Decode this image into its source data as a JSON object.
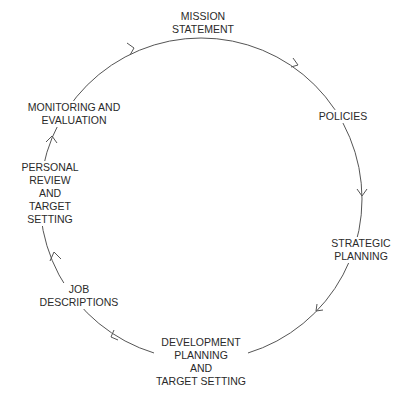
{
  "diagram": {
    "type": "cycle",
    "direction": "clockwise",
    "colors": {
      "line": "#555555",
      "text": "#2a2a2a",
      "background": "#ffffff"
    },
    "nodes": [
      {
        "id": "mission",
        "lines": [
          "MISSION",
          "STATEMENT"
        ]
      },
      {
        "id": "policies",
        "lines": [
          "POLICIES"
        ]
      },
      {
        "id": "strategic",
        "lines": [
          "STRATEGIC",
          "PLANNING"
        ]
      },
      {
        "id": "development",
        "lines": [
          "DEVELOPMENT",
          "PLANNING",
          "AND",
          "TARGET SETTING"
        ]
      },
      {
        "id": "job",
        "lines": [
          "JOB",
          "DESCRIPTIONS"
        ]
      },
      {
        "id": "personal",
        "lines": [
          "PERSONAL",
          "REVIEW",
          "AND",
          "TARGET",
          "SETTING"
        ]
      },
      {
        "id": "monitoring",
        "lines": [
          "MONITORING AND",
          "EVALUATION"
        ]
      }
    ],
    "edges": [
      [
        "mission",
        "policies"
      ],
      [
        "policies",
        "strategic"
      ],
      [
        "strategic",
        "development"
      ],
      [
        "development",
        "job"
      ],
      [
        "job",
        "personal"
      ],
      [
        "personal",
        "monitoring"
      ],
      [
        "monitoring",
        "mission"
      ]
    ]
  }
}
